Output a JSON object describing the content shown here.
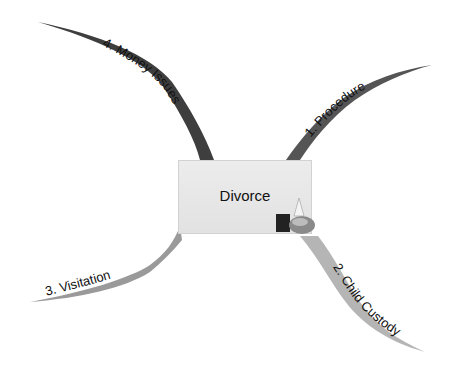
{
  "central_topic": {
    "label": "Divorce",
    "fill": "#e6e6e6"
  },
  "branches": [
    {
      "id": 1,
      "label": "1. Procedure",
      "color": "#555555"
    },
    {
      "id": 2,
      "label": "2. Child Custody",
      "color": "#b5b5b5"
    },
    {
      "id": 3,
      "label": "3. Visitation",
      "color": "#9a9a9a"
    },
    {
      "id": 4,
      "label": "4. Money Issues",
      "color": "#3e3e3e"
    }
  ],
  "icons": {
    "central_attachment": "tools-icon"
  }
}
